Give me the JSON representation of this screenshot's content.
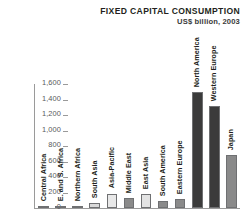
{
  "chart_data": {
    "type": "bar",
    "title": "FIXED CAPITAL CONSUMPTION",
    "subtitle": "US$ billion, 2003",
    "xlabel": "",
    "ylabel": "",
    "ylim": [
      0,
      1600
    ],
    "yticks": [
      0,
      200,
      400,
      600,
      800,
      1000,
      1200,
      1400,
      1600
    ],
    "ytick_labels": [
      "0",
      "200",
      "400",
      "600",
      "800",
      "1,000",
      "1,200",
      "1,400",
      "1,600"
    ],
    "grid": false,
    "legend": "none",
    "categories": [
      "Central Africa",
      "E. and S. Africa",
      "Northern Africa",
      "South Asia",
      "Asia-Pacific",
      "Middle East",
      "East Asia",
      "South America",
      "Eastern Europe",
      "North America",
      "Western Europe",
      "Japan"
    ],
    "values": [
      8,
      20,
      28,
      60,
      185,
      130,
      180,
      90,
      110,
      1500,
      1310,
      680
    ],
    "bar_colors": [
      "#d9d9d9",
      "#d9d9d9",
      "#d9d9d9",
      "#d9d9d9",
      "#e8e8e8",
      "#8a8a8a",
      "#e3e3e3",
      "#8a8a8a",
      "#8a8a8a",
      "#3b3b3b",
      "#3b3b3b",
      "#8a8a8a"
    ]
  },
  "colors": {
    "axis": "#9a9a9a",
    "text": "#231f20",
    "tick_text": "#58595b",
    "background": "#ffffff"
  }
}
